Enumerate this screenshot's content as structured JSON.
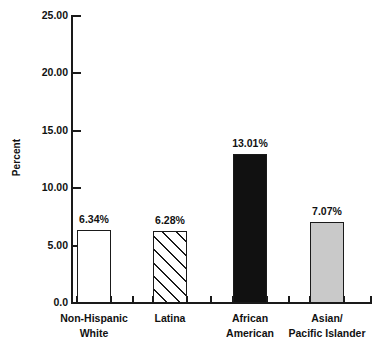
{
  "chart_data": {
    "type": "bar",
    "title": "",
    "xlabel": "",
    "ylabel": "Percent",
    "ylim": [
      0,
      25
    ],
    "grid": false,
    "legend": "none",
    "categories": [
      "Non-Hispanic\nWhite",
      "Latina",
      "African\nAmerican",
      "Asian/\nPacific Islander"
    ],
    "values": [
      6.34,
      6.28,
      13.01,
      7.07
    ],
    "data_labels": [
      "6.34%",
      "6.28%",
      "13.01%",
      "7.07%"
    ],
    "bar_styles": [
      "white",
      "hatch",
      "black",
      "gray"
    ],
    "ytick_labels": [
      "0.0",
      "5.00",
      "10.00",
      "15.00",
      "20.00",
      "25.00"
    ],
    "ytick_values": [
      0,
      5,
      10,
      15,
      20,
      25
    ]
  },
  "colors": {
    "axis": "#1a1a1a",
    "bar_black": "#111111",
    "bar_gray": "#c9c9c9",
    "bar_white": "#ffffff",
    "background": "#ffffff"
  }
}
